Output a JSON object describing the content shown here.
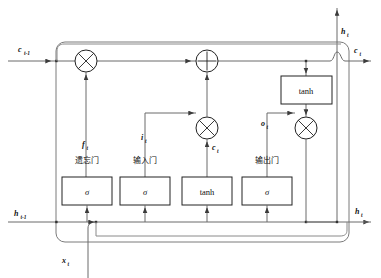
{
  "diagram": {
    "colors": {
      "line": "#5a5a5a",
      "line_dark": "#222222",
      "box_stroke": "#222222",
      "text": "#111111",
      "background": "#ffffff"
    },
    "outer_border": {
      "name": "lstm-cell-boundary",
      "corner_radius": 8
    },
    "inputs": [
      {
        "id": "c_prev",
        "base": "c",
        "sub": "t-1",
        "side": "left-top",
        "label": "c"
      },
      {
        "id": "h_prev",
        "base": "h",
        "sub": "t-1",
        "side": "left-bottom",
        "label": "h"
      },
      {
        "id": "x_t",
        "base": "x",
        "sub": "t",
        "side": "bottom",
        "label": "x"
      }
    ],
    "outputs": [
      {
        "id": "c_t",
        "base": "c",
        "sub": "t",
        "side": "right-top",
        "label": "c"
      },
      {
        "id": "h_t_top",
        "base": "h",
        "sub": "t",
        "side": "top-right",
        "label": "h"
      },
      {
        "id": "h_t_right",
        "base": "h",
        "sub": "t",
        "side": "right-bottom",
        "label": "h"
      }
    ],
    "gates": [
      {
        "id": "forget-gate",
        "cn_label": "遗忘门",
        "signal_base": "f",
        "signal_sub": "t",
        "activation": "σ"
      },
      {
        "id": "input-gate",
        "cn_label": "输入门",
        "signal_base": "i",
        "signal_sub": "t",
        "activation": "σ"
      },
      {
        "id": "candidate",
        "cn_label": "",
        "signal_base": "c",
        "signal_sub": "t",
        "activation": "tanh"
      },
      {
        "id": "output-gate",
        "cn_label": "输出门",
        "signal_base": "o",
        "signal_sub": "t",
        "activation": "σ"
      }
    ],
    "activation_boxes": [
      {
        "id": "forget-sigma-box",
        "label": "σ",
        "italic": true
      },
      {
        "id": "input-sigma-box",
        "label": "σ",
        "italic": true
      },
      {
        "id": "candidate-tanh-box",
        "label": "tanh",
        "italic": false
      },
      {
        "id": "output-sigma-box",
        "label": "σ",
        "italic": false
      },
      {
        "id": "cell-tanh-box",
        "label": "tanh",
        "italic": false
      }
    ],
    "operators": [
      {
        "id": "forget-multiply",
        "symbol": "×",
        "shape": "circle-cross"
      },
      {
        "id": "sum-node",
        "symbol": "+",
        "shape": "circle-plus"
      },
      {
        "id": "input-multiply",
        "symbol": "×",
        "shape": "circle-cross"
      },
      {
        "id": "output-multiply",
        "symbol": "×",
        "shape": "circle-cross"
      }
    ],
    "inline_labels": {
      "c_prev_base": "c",
      "c_prev_sub": "t-1",
      "h_prev_base": "h",
      "h_prev_sub": "t-1",
      "x_base": "x",
      "x_sub": "t",
      "c_out_base": "c",
      "c_out_sub": "t",
      "h_out_base": "h",
      "h_out_sub": "t",
      "h_top_base": "h",
      "h_top_sub": "t",
      "f_base": "f",
      "f_sub": "t",
      "i_base": "i",
      "i_sub": "t",
      "o_base": "o",
      "o_sub": "t",
      "cand_base": "c",
      "cand_sub": "t",
      "forget_cn": "遗忘门",
      "input_cn": "输入门",
      "output_cn": "输出门",
      "sigma": "σ",
      "tanh": "tanh"
    }
  }
}
